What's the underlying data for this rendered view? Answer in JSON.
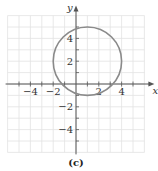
{
  "chart_data": {
    "type": "line",
    "title": "",
    "caption": "(c)",
    "xlabel": "x",
    "ylabel": "y",
    "xlim": [
      -6,
      6
    ],
    "ylim": [
      -6,
      6
    ],
    "grid": true,
    "x_ticks": [
      "-4",
      "-2",
      "2",
      "4"
    ],
    "y_ticks": [
      "4",
      "2",
      "-2",
      "-4"
    ],
    "series": [
      {
        "name": "circle",
        "shape": "circle",
        "center": [
          1,
          2
        ],
        "radius": 3,
        "color": "#8a8a8a"
      }
    ]
  }
}
